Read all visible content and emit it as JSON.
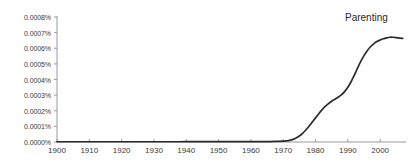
{
  "chart_data": {
    "type": "line",
    "title": "",
    "xlabel": "",
    "ylabel": "",
    "xlim": [
      1900,
      2008
    ],
    "ylim": [
      0,
      0.0008
    ],
    "grid": false,
    "legend_position": "top-right-inline",
    "y_tick_labels": [
      "0.0008%",
      "0.0007%",
      "0.0006%",
      "0.0005%",
      "0.0004%",
      "0.0003%",
      "0.0002%",
      "0.0001%",
      "0.0000%"
    ],
    "y_tick_values": [
      0.0008,
      0.0007,
      0.0006,
      0.0005,
      0.0004,
      0.0003,
      0.0002,
      0.0001,
      0.0
    ],
    "x_tick_labels": [
      "1900",
      "1910",
      "1920",
      "1930",
      "1940",
      "1950",
      "1960",
      "1970",
      "1980",
      "1990",
      "2000"
    ],
    "x_tick_values": [
      1900,
      1910,
      1920,
      1930,
      1940,
      1950,
      1960,
      1970,
      1980,
      1990,
      2000
    ],
    "series": [
      {
        "name": "Parenting",
        "color": "#2b2b2b",
        "x": [
          1900,
          1905,
          1910,
          1915,
          1920,
          1925,
          1930,
          1935,
          1940,
          1945,
          1950,
          1955,
          1960,
          1963,
          1966,
          1968,
          1970,
          1971,
          1972,
          1973,
          1974,
          1975,
          1976,
          1977,
          1978,
          1979,
          1980,
          1981,
          1982,
          1983,
          1984,
          1985,
          1986,
          1987,
          1988,
          1989,
          1990,
          1991,
          1992,
          1993,
          1994,
          1995,
          1996,
          1997,
          1998,
          1999,
          2000,
          2001,
          2002,
          2003,
          2004,
          2005,
          2006,
          2007
        ],
        "values": [
          1.5e-06,
          1.5e-06,
          1.5e-06,
          1.5e-06,
          1.6e-06,
          1.6e-06,
          1.7e-06,
          1.7e-06,
          1.8e-06,
          1.8e-06,
          1.9e-06,
          2e-06,
          2.2e-06,
          2.5e-06,
          3e-06,
          3.8e-06,
          5e-06,
          7e-06,
          1.05e-05,
          1.65e-05,
          2.55e-05,
          3.85e-05,
          5.55e-05,
          7.65e-05,
          0.000101,
          0.0001275,
          0.0001545,
          0.000181,
          0.000206,
          0.0002275,
          0.0002455,
          0.0002605,
          0.0002735,
          0.0002865,
          0.000302,
          0.0003225,
          0.00035,
          0.0003855,
          0.0004275,
          0.0004725,
          0.0005155,
          0.000553,
          0.0005845,
          0.0006095,
          0.0006285,
          0.0006425,
          0.0006525,
          0.0006605,
          0.0006665,
          0.0006705,
          0.0006705,
          0.000668,
          0.0006645,
          0.000663
        ]
      }
    ]
  },
  "axis": {
    "axis_line_color": "#9a9a9a",
    "tick_color": "#9a9a9a",
    "label_color": "#3a3a3a"
  },
  "annotations": {
    "series_label": "Parenting"
  }
}
